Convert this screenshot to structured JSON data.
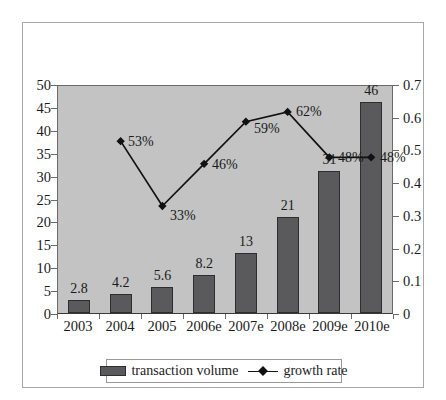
{
  "chart_data": {
    "type": "bar",
    "title": "",
    "subtitle": "",
    "xlabel": "",
    "ylabel": "",
    "categories": [
      "2003",
      "2004",
      "2005",
      "2006e",
      "2007e",
      "2008e",
      "2009e",
      "2010e"
    ],
    "grid": false,
    "legend_position": "bottom",
    "series": [
      {
        "name": "transaction volume",
        "type": "bar",
        "axis": "left",
        "color": "#5a5a5c",
        "values": [
          2.8,
          4.2,
          5.6,
          8.2,
          13,
          21,
          31,
          46
        ],
        "data_labels": [
          "2.8",
          "4.2",
          "5.6",
          "8.2",
          "13",
          "21",
          "31",
          "46"
        ]
      },
      {
        "name": "growth rate",
        "type": "line",
        "axis": "right",
        "color": "#111111",
        "marker": "diamond",
        "values": [
          null,
          0.53,
          0.33,
          0.46,
          0.59,
          0.62,
          0.48,
          0.48
        ],
        "data_labels": [
          "",
          "53%",
          "33%",
          "46%",
          "59%",
          "62%",
          "48%",
          "48%"
        ]
      }
    ],
    "left_axis": {
      "min": 0,
      "max": 50,
      "step": 5,
      "ticks": [
        "0",
        "5",
        "10",
        "15",
        "20",
        "25",
        "30",
        "35",
        "40",
        "45",
        "50"
      ]
    },
    "right_axis": {
      "min": 0,
      "max": 0.7,
      "step": 0.1,
      "ticks": [
        "0",
        "0.1",
        "0.2",
        "0.3",
        "0.4",
        "0.5",
        "0.6",
        "0.7"
      ]
    }
  },
  "legend": {
    "entries": [
      {
        "label": "transaction volume",
        "marker": "bar-swatch"
      },
      {
        "label": "growth rate",
        "marker": "line-diamond"
      }
    ]
  },
  "colors": {
    "bar_fill": "#5a5a5c",
    "bar_stroke": "#2e2e30",
    "plot_background": "#c3c3c3",
    "line": "#111111",
    "frame_border": "#a8a8ac",
    "text": "#1a1a1a"
  }
}
